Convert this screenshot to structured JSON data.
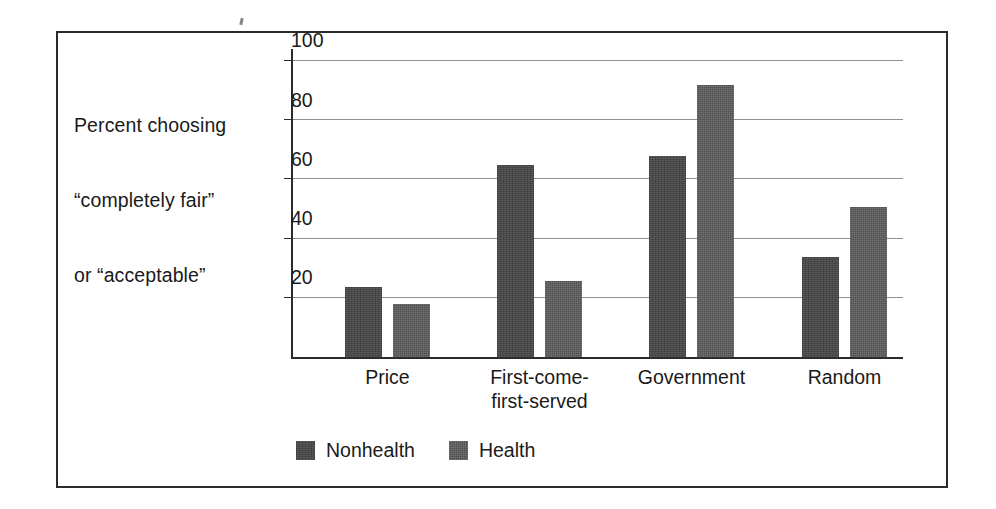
{
  "figure": {
    "background_color": "#ffffff",
    "frame_color": "#2b2b2b",
    "axis_color": "#2b2b2b",
    "gridline_color": "#8e8e8e"
  },
  "y_axis_caption": {
    "line1": "Percent choosing",
    "line2": "“completely fair”",
    "line3": "or “acceptable”"
  },
  "chart_data": {
    "type": "bar",
    "title": "",
    "xlabel": "",
    "ylabel": "Percent choosing “completely fair” or “acceptable”",
    "categories": [
      "Price",
      "First-come-first-served",
      "Government",
      "Random"
    ],
    "category_label_lines": [
      [
        "Price"
      ],
      [
        "First-come-",
        "first-served"
      ],
      [
        "Government"
      ],
      [
        "Random"
      ]
    ],
    "series": [
      {
        "name": "Nonhealth",
        "color": "#4a4a4a",
        "values": [
          23.7,
          64.8,
          68.0,
          33.8
        ]
      },
      {
        "name": "Health",
        "color": "#4f4f4f",
        "values": [
          18.0,
          25.8,
          91.8,
          50.8
        ]
      }
    ],
    "ylim": [
      0,
      104
    ],
    "yticks": [
      20,
      40,
      60,
      80,
      100
    ],
    "ytick_labels": [
      "20",
      "40",
      "60",
      "80",
      "100"
    ],
    "grid": true,
    "legend_position": "bottom-left"
  },
  "legend": {
    "items": [
      {
        "label": "Nonhealth",
        "series_class": "series-nonhealth"
      },
      {
        "label": "Health",
        "series_class": "series-health"
      }
    ]
  }
}
